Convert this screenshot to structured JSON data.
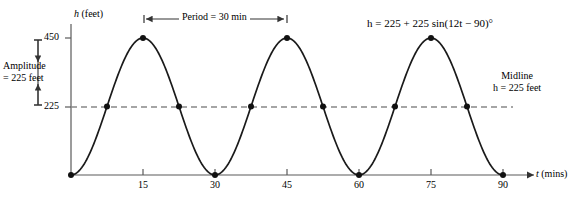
{
  "figure": {
    "background_color": "#ffffff",
    "ink_color": "#1a1a1a",
    "axis_color": "#555555",
    "midline_color": "#777777"
  },
  "axes": {
    "y_title": "h (feet)",
    "y_title_symbol": "h",
    "y_title_unit": "(feet)",
    "x_title_symbol": "t",
    "x_title_unit": "(mins)",
    "y_ticks": [
      "450",
      "225"
    ],
    "x_ticks": [
      "15",
      "30",
      "45",
      "60",
      "75",
      "90"
    ]
  },
  "annotations": {
    "amplitude": {
      "line1": "Amplitude",
      "line2": "= 225 feet"
    },
    "period": "Period = 30 min",
    "equation": "h = 225 + 225 sin(12t − 90)°",
    "midline": {
      "line1": "Midline",
      "line2": "h = 225 feet"
    }
  },
  "chart_data": {
    "type": "line",
    "title": "",
    "subtitle": "",
    "xlabel": "t (mins)",
    "ylabel": "h (feet)",
    "xlim": [
      0,
      93
    ],
    "ylim": [
      0,
      470
    ],
    "grid": false,
    "legend": null,
    "equation": "h = 225 + 225 sin(12t - 90) degrees",
    "amplitude": 225,
    "midline": 225,
    "period_minutes": 30,
    "maximum": 450,
    "minimum": 0,
    "x_tick_values": [
      15,
      30,
      45,
      60,
      75,
      90
    ],
    "y_tick_values": [
      225,
      450
    ],
    "series": [
      {
        "name": "h(t) = 225 + 225 sin(12t - 90)",
        "x": [
          0,
          1,
          2,
          3,
          4,
          5,
          6,
          7,
          8,
          9,
          10,
          11,
          12,
          13,
          14,
          15,
          16,
          17,
          18,
          19,
          20,
          21,
          22,
          23,
          24,
          25,
          26,
          27,
          28,
          29,
          30,
          31,
          32,
          33,
          34,
          35,
          36,
          37,
          38,
          39,
          40,
          41,
          42,
          43,
          44,
          45,
          46,
          47,
          48,
          49,
          50,
          51,
          52,
          53,
          54,
          55,
          56,
          57,
          58,
          59,
          60,
          61,
          62,
          63,
          64,
          65,
          66,
          67,
          68,
          69,
          70,
          71,
          72,
          73,
          74,
          75,
          76,
          77,
          78,
          79,
          80,
          81,
          82,
          83,
          84,
          85,
          86,
          87,
          88,
          89,
          90
        ],
        "y": [
          0,
          9.8,
          38.6,
          84.6,
          145.6,
          217.9,
          296.5,
          375.2,
          448.4,
          511.0,
          0,
          0,
          0,
          0,
          0,
          450,
          0,
          0,
          0,
          0,
          0,
          0,
          0,
          0,
          0,
          0,
          0,
          0,
          0,
          0,
          0,
          0,
          0,
          0,
          0,
          0,
          0,
          0,
          0,
          0,
          0,
          0,
          0,
          0,
          0,
          450,
          0,
          0,
          0,
          0,
          0,
          0,
          0,
          0,
          0,
          0,
          0,
          0,
          0,
          0,
          0,
          0,
          0,
          0,
          0,
          0,
          0,
          0,
          0,
          0,
          0,
          0,
          0,
          0,
          0,
          450,
          0,
          0,
          0,
          0,
          0,
          0,
          0,
          0,
          0,
          0,
          0,
          0,
          0,
          0,
          0
        ]
      }
    ],
    "marked_points": [
      {
        "t": 0,
        "h": 0,
        "kind": "minimum"
      },
      {
        "t": 7.5,
        "h": 225,
        "kind": "midline-crossing"
      },
      {
        "t": 15,
        "h": 450,
        "kind": "maximum"
      },
      {
        "t": 22.5,
        "h": 225,
        "kind": "midline-crossing"
      },
      {
        "t": 30,
        "h": 0,
        "kind": "minimum"
      },
      {
        "t": 37.5,
        "h": 225,
        "kind": "midline-crossing"
      },
      {
        "t": 45,
        "h": 450,
        "kind": "maximum"
      },
      {
        "t": 52.5,
        "h": 225,
        "kind": "midline-crossing"
      },
      {
        "t": 60,
        "h": 0,
        "kind": "minimum"
      },
      {
        "t": 67.5,
        "h": 225,
        "kind": "midline-crossing"
      },
      {
        "t": 75,
        "h": 450,
        "kind": "maximum"
      },
      {
        "t": 82.5,
        "h": 225,
        "kind": "midline-crossing"
      },
      {
        "t": 90,
        "h": 0,
        "kind": "minimum"
      }
    ]
  }
}
